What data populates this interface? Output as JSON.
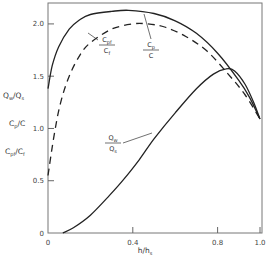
{
  "chart_data": {
    "type": "line",
    "title": "",
    "xlabel": "h/h_s",
    "xlabel_main": "h/h",
    "xlabel_sub": "s",
    "ylabels": [
      {
        "num": "Q",
        "num_sub": "w",
        "den": "Q",
        "den_sub": "s"
      },
      {
        "num": "C",
        "num_sub": "p",
        "den": "C",
        "den_sub": ""
      },
      {
        "num": "C",
        "num_sub": "pf",
        "den": "C",
        "den_sub": "f"
      }
    ],
    "xlim": [
      0,
      1.0
    ],
    "ylim": [
      0,
      2.2
    ],
    "xticks": [
      0,
      0.4,
      0.8,
      1.0
    ],
    "xtick_labels": [
      "0",
      "0.4",
      "0.8",
      "1.0"
    ],
    "yticks": [
      0,
      0.5,
      1.0,
      1.5,
      2.0
    ],
    "ytick_labels": [
      "0",
      "0.5",
      "1.0",
      "1.5",
      "2.0"
    ],
    "grid": false,
    "series": [
      {
        "name": "Cp/C",
        "style": "solid",
        "x": [
          0.0,
          0.02,
          0.05,
          0.1,
          0.15,
          0.2,
          0.3,
          0.38,
          0.5,
          0.6,
          0.7,
          0.8,
          0.9,
          0.95,
          1.0
        ],
        "y": [
          1.38,
          1.6,
          1.78,
          1.95,
          2.04,
          2.09,
          2.12,
          2.13,
          2.1,
          2.03,
          1.91,
          1.72,
          1.46,
          1.3,
          1.09
        ]
      },
      {
        "name": "Cpf/Cf",
        "style": "dashed",
        "x": [
          0.0,
          0.03,
          0.06,
          0.1,
          0.15,
          0.2,
          0.3,
          0.4,
          0.47,
          0.55,
          0.65,
          0.75,
          0.85,
          0.93,
          1.0
        ],
        "y": [
          0.55,
          0.95,
          1.25,
          1.5,
          1.7,
          1.82,
          1.95,
          2.0,
          2.0,
          1.97,
          1.88,
          1.74,
          1.52,
          1.32,
          1.09
        ]
      },
      {
        "name": "Qw/Qs",
        "style": "solid",
        "x": [
          0.07,
          0.12,
          0.2,
          0.29,
          0.36,
          0.43,
          0.5,
          0.6,
          0.7,
          0.78,
          0.84,
          0.88,
          0.93,
          0.97,
          1.0
        ],
        "y": [
          0.0,
          0.05,
          0.17,
          0.36,
          0.52,
          0.7,
          0.9,
          1.15,
          1.38,
          1.52,
          1.57,
          1.55,
          1.42,
          1.25,
          1.09
        ]
      }
    ],
    "annotations": [
      {
        "label_num": "C",
        "label_num_sub": "pf",
        "label_den": "C",
        "label_den_sub": "f",
        "points_to": "Cpf/Cf",
        "at_x": 0.2
      },
      {
        "label_num": "C",
        "label_num_sub": "p",
        "label_den": "C",
        "label_den_sub": "",
        "points_to": "Cp/C",
        "at_x": 0.62
      },
      {
        "label_num": "Q",
        "label_num_sub": "w",
        "label_den": "Q",
        "label_den_sub": "s",
        "points_to": "Qw/Qs",
        "at_x": 0.55
      }
    ],
    "colors": {
      "line": "#222222",
      "axis": "#555555",
      "text": "#333333"
    }
  }
}
